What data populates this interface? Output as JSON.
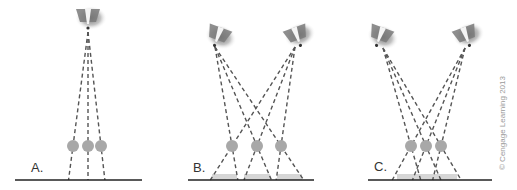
{
  "figure": {
    "colors": {
      "background": "#ffffff",
      "ground": "#222222",
      "rays": "#555555",
      "ball": "#a8a8a8",
      "shadow": "#d6d6d6",
      "lamp_body": "#7a7a7a"
    },
    "panels": [
      {
        "label": "A.",
        "lamps": [
          {
            "x": 88,
            "y": 18,
            "angle": 0,
            "source": [
              88,
              32
            ]
          }
        ],
        "balls": [
          [
            73,
            146
          ],
          [
            88,
            146
          ],
          [
            101,
            146
          ]
        ],
        "ground": {
          "x1": 15,
          "x2": 142,
          "y": 180
        },
        "shadows": []
      },
      {
        "label": "B.",
        "lamps": [
          {
            "x": 218,
            "y": 36,
            "angle": 20,
            "source": [
              215,
              47
            ]
          },
          {
            "x": 297,
            "y": 36,
            "angle": -20,
            "source": [
              295,
              47
            ]
          }
        ],
        "balls": [
          [
            232,
            146
          ],
          [
            257,
            146
          ],
          [
            281,
            146
          ]
        ],
        "ground": {
          "x1": 188,
          "x2": 314,
          "y": 180
        },
        "shadows": [
          [
            212,
            237
          ],
          [
            244,
            270
          ],
          [
            277,
            302
          ]
        ]
      },
      {
        "label": "C.",
        "lamps": [
          {
            "x": 380,
            "y": 36,
            "angle": 20,
            "source": [
              383,
              48
            ]
          },
          {
            "x": 466,
            "y": 36,
            "angle": -20,
            "source": [
              465,
              48
            ]
          }
        ],
        "balls": [
          [
            411,
            146
          ],
          [
            426,
            146
          ],
          [
            441,
            146
          ]
        ],
        "ground": {
          "x1": 368,
          "x2": 492,
          "y": 180
        },
        "shadows": [
          [
            397,
            457
          ]
        ]
      }
    ],
    "copyright": "© Cengage Learning 2013"
  }
}
